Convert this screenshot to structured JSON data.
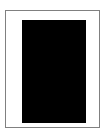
{
  "canvas": {
    "width": 107,
    "height": 135,
    "background_color": "#ffffff"
  },
  "page_frame": {
    "name": "page-border",
    "border_color": "#808080",
    "border_width_px": 1,
    "fill_color": "#ffffff",
    "x": 5,
    "y": 10,
    "width": 95,
    "height": 118
  },
  "content_block": {
    "name": "black-content-block",
    "fill_color": "#000000",
    "x": 21,
    "y": 19,
    "width": 64,
    "height": 103,
    "label": ""
  },
  "caption": {
    "text": ""
  }
}
